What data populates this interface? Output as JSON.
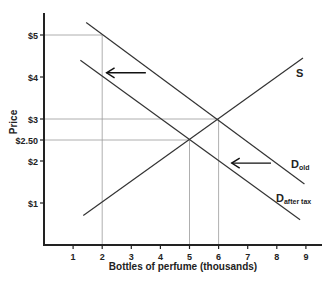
{
  "chart_data": {
    "type": "line",
    "title": "",
    "xlabel": "Bottles of perfume (thousands)",
    "ylabel": "Price",
    "xlim": [
      0,
      9.5
    ],
    "ylim": [
      0,
      5.5
    ],
    "x_ticks": [
      1,
      2,
      3,
      4,
      5,
      6,
      7,
      8,
      9
    ],
    "x_tick_labels": [
      "1",
      "2",
      "3",
      "4",
      "5",
      "6",
      "7",
      "8",
      "9"
    ],
    "y_ticks": [
      1,
      2,
      2.5,
      3,
      4,
      5
    ],
    "y_tick_labels": [
      "$1",
      "$2",
      "$2.50",
      "$3",
      "$4",
      "$5"
    ],
    "grid": false,
    "series": [
      {
        "name": "S",
        "points": [
          [
            1.35,
            0.7
          ],
          [
            8.9,
            4.45
          ]
        ]
      },
      {
        "name": "D_old",
        "label_main": "D",
        "label_sub": "old",
        "points": [
          [
            1.45,
            5.3
          ],
          [
            8.95,
            1.45
          ]
        ]
      },
      {
        "name": "D_after tax",
        "label_main": "D",
        "label_sub": "after tax",
        "points": [
          [
            1.25,
            4.4
          ],
          [
            8.8,
            0.6
          ]
        ]
      }
    ],
    "reference_lines": [
      {
        "type": "horizontal",
        "y": 5,
        "x_to": 2
      },
      {
        "type": "vertical",
        "x": 2,
        "y_to": 5
      },
      {
        "type": "horizontal",
        "y": 3,
        "x_to": 6
      },
      {
        "type": "vertical",
        "x": 6,
        "y_to": 3
      },
      {
        "type": "horizontal",
        "y": 2.5,
        "x_to": 5
      },
      {
        "type": "vertical",
        "x": 5,
        "y_to": 2.5
      }
    ],
    "annotations": [
      {
        "type": "arrow",
        "direction": "left",
        "from": [
          3.5,
          4.1
        ],
        "to": [
          2.15,
          4.1
        ]
      },
      {
        "type": "arrow",
        "direction": "left",
        "from": [
          7.8,
          1.95
        ],
        "to": [
          6.45,
          1.95
        ]
      }
    ]
  }
}
